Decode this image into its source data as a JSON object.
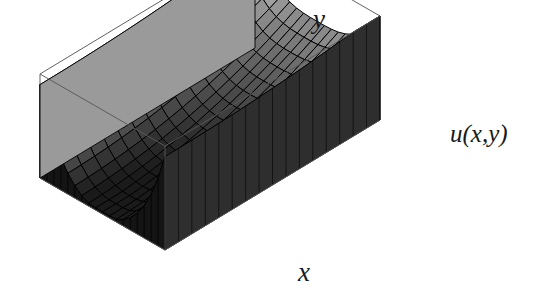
{
  "figure": {
    "kind": "3d-surface-mesh-plot",
    "background_color": "#ffffff",
    "box_line_color": "#5a5a5a",
    "mesh_line_color": "#000000",
    "width": 548,
    "height": 296
  },
  "labels": {
    "x_axis": "x",
    "y_axis": "y",
    "z_axis": "u(x,y)"
  },
  "chart_data": {
    "type": "surface",
    "title": "",
    "xlabel": "x",
    "ylabel": "y",
    "zlabel": "u(x,y)",
    "grid": false,
    "legend": "none",
    "colormap": "grayscale",
    "shading_low_color": "#1c1c1c",
    "shading_high_color": "#e8e8e8",
    "ticks_shown": false,
    "tick_labels": [],
    "axis_ranges": {
      "x": [
        0,
        1
      ],
      "y": [
        0,
        1
      ],
      "z": [
        0,
        1
      ]
    },
    "mesh_divisions": {
      "nx": 18,
      "ny": 16
    },
    "surface_description": "Valley / trough shaped surface: high along the x=0 and x=1 boundaries and along y=1, dipping to a minimum in the front-centre region; drawn as a shaded wireframe inside an open rectangular bounding box.",
    "view": {
      "azimuth_deg": -37,
      "elevation_deg": 26
    },
    "z_formula": "u(x,y) = high at side and back walls, smoothly decaying to a broad minimum near the front centre"
  }
}
